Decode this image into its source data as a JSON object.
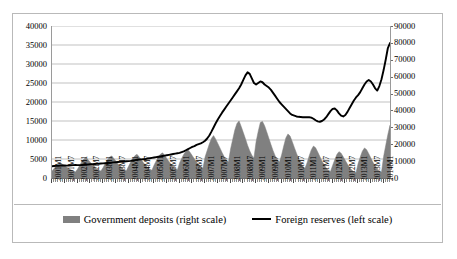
{
  "chart_data": {
    "type": "area",
    "title": "",
    "xlabel": "",
    "ylabel": "",
    "ylim": [
      0,
      40000
    ],
    "y2lim": [
      0,
      90000
    ],
    "grid": true,
    "legend_position": "bottom",
    "left_axis_ticks": [
      "0",
      "5000",
      "10000",
      "15000",
      "20000",
      "25000",
      "30000",
      "35000",
      "40000"
    ],
    "right_axis_ticks": [
      "0",
      "10000",
      "20000",
      "30000",
      "40000",
      "50000",
      "60000",
      "70000",
      "80000",
      "90000"
    ],
    "x_tick_labels": [
      "2001M1",
      "2001M7",
      "2002M1",
      "2002M7",
      "2003M1",
      "2003M7",
      "2004M1",
      "2004M7",
      "2005M1",
      "2005M7",
      "2006M1",
      "2006M7",
      "2007M1",
      "2007M7",
      "2008M1",
      "2008M7",
      "2009M1",
      "2009M7",
      "2010M1",
      "2010M7",
      "2011M1",
      "2011M7",
      "2012M1",
      "2012M7",
      "2013M1",
      "2013M7",
      "2014M1"
    ],
    "x_start": "2001M1",
    "x_end": "2014M4",
    "series": [
      {
        "name": "Government deposits (right scale)",
        "type": "area",
        "axis": "right",
        "color": "#808080",
        "values": [
          4200,
          5600,
          7100,
          8200,
          9000,
          8100,
          7200,
          6400,
          5500,
          4700,
          4100,
          3600,
          5200,
          7400,
          9600,
          11200,
          12100,
          10800,
          9300,
          7900,
          6600,
          5400,
          4600,
          4100,
          6100,
          8400,
          10600,
          12300,
          13100,
          11700,
          10100,
          8500,
          7000,
          5800,
          4900,
          4300,
          6900,
          9300,
          11500,
          13200,
          14000,
          12500,
          10800,
          9100,
          7500,
          6200,
          5200,
          4600,
          7600,
          10100,
          12400,
          14100,
          14900,
          13400,
          11600,
          9800,
          8100,
          6700,
          5600,
          4900,
          8900,
          11600,
          14000,
          15800,
          16700,
          15100,
          13200,
          11300,
          9400,
          7800,
          6600,
          5800,
          12400,
          16300,
          20100,
          23400,
          25100,
          23000,
          20400,
          17800,
          15100,
          12600,
          10600,
          9400,
          17200,
          22800,
          28400,
          32200,
          33800,
          30500,
          26900,
          23200,
          19400,
          16100,
          13500,
          11900,
          21400,
          27600,
          32900,
          33500,
          31000,
          27400,
          23600,
          19800,
          16200,
          13100,
          10800,
          9400,
          13600,
          18900,
          23700,
          26100,
          24800,
          21600,
          18100,
          14700,
          11600,
          9000,
          7000,
          5700,
          9100,
          13200,
          16800,
          18900,
          17900,
          15400,
          12700,
          10100,
          7800,
          5900,
          4600,
          3800,
          7400,
          10800,
          13900,
          15600,
          14700,
          12600,
          10300,
          8100,
          6200,
          4700,
          3700,
          3100,
          8600,
          12400,
          15900,
          17800,
          16800,
          14400,
          11800,
          9300,
          7100,
          5400,
          4200,
          3500,
          12800,
          19400,
          25800,
          31200
        ]
      },
      {
        "name": "Foreign reserves (left scale)",
        "type": "line",
        "axis": "left",
        "color": "#000000",
        "values": [
          3100,
          3150,
          3180,
          3200,
          3250,
          3300,
          3280,
          3260,
          3300,
          3350,
          3400,
          3420,
          3400,
          3380,
          3420,
          3480,
          3520,
          3560,
          3600,
          3650,
          3700,
          3720,
          3750,
          3800,
          3850,
          3900,
          3950,
          4000,
          4050,
          4100,
          4150,
          4200,
          4250,
          4300,
          4350,
          4400,
          4450,
          4500,
          4600,
          4700,
          4800,
          4850,
          4900,
          4950,
          5000,
          5100,
          5200,
          5300,
          5400,
          5500,
          5600,
          5700,
          5800,
          5900,
          6000,
          6100,
          6200,
          6300,
          6400,
          6500,
          6600,
          6800,
          7000,
          7300,
          7600,
          7900,
          8200,
          8400,
          8700,
          8900,
          9100,
          9400,
          9800,
          10400,
          11200,
          12200,
          13300,
          14400,
          15400,
          16300,
          17200,
          18000,
          18800,
          19600,
          20400,
          21200,
          22000,
          22800,
          23600,
          24600,
          25800,
          27000,
          27800,
          27400,
          26200,
          25000,
          24600,
          25000,
          25400,
          25200,
          24600,
          24200,
          23800,
          23200,
          22400,
          21600,
          20800,
          20000,
          19400,
          18800,
          18200,
          17600,
          17000,
          16600,
          16400,
          16200,
          16100,
          16050,
          16000,
          16000,
          16000,
          16000,
          15900,
          15600,
          15200,
          14900,
          14800,
          15000,
          15400,
          16000,
          16800,
          17600,
          18200,
          18300,
          17800,
          17000,
          16400,
          16200,
          16600,
          17400,
          18400,
          19400,
          20400,
          21200,
          21800,
          22600,
          23600,
          24600,
          25400,
          25800,
          25400,
          24600,
          23600,
          23000,
          24200,
          26000,
          28400,
          31200,
          34200,
          35500
        ]
      }
    ]
  },
  "legend": {
    "deposits_label": "Government deposits (right scale)",
    "reserves_label": "Foreign reserves (left scale)"
  }
}
